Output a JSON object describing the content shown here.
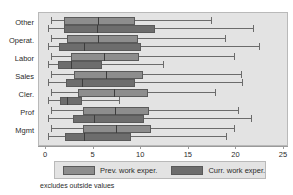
{
  "chart_data": {
    "type": "box",
    "title": "",
    "xlabel": "",
    "ylabel": "",
    "xlim": [
      0,
      25
    ],
    "xticks": [
      0,
      5,
      10,
      15,
      20,
      25
    ],
    "xticklabels": [
      "0",
      "5",
      "10",
      "15",
      "20",
      "25"
    ],
    "grid": false,
    "orientation": "horizontal",
    "categories": [
      "Other",
      "Operat.",
      "Labor",
      "Sales",
      "Cler.",
      "Prof",
      "Mgmt"
    ],
    "legend_position": "bottom",
    "footnote": "excludes outside values",
    "colors": {
      "prev": "#8d8d8d",
      "curr": "#6d6d6d",
      "plot_background": "#e3e3e3",
      "frame": "#b9b9b9",
      "line": "#6b6b6b",
      "text": "#2b2b2b"
    },
    "series": [
      {
        "name": "Prev. work exper.",
        "key": "prev",
        "boxes": [
          {
            "category": "Other",
            "whisker_low": 0.5,
            "q1": 1.9,
            "median": 5.5,
            "q3": 9.3,
            "whisker_high": 17.3
          },
          {
            "category": "Operat.",
            "whisker_low": 0.5,
            "q1": 2.2,
            "median": 5.5,
            "q3": 9.7,
            "whisker_high": 18.8
          },
          {
            "category": "Labor",
            "whisker_low": 0.5,
            "q1": 2.6,
            "median": 6.1,
            "q3": 9.8,
            "whisker_high": 19.8
          },
          {
            "category": "Sales",
            "whisker_low": 0.5,
            "q1": 2.9,
            "median": 6.3,
            "q3": 10.2,
            "whisker_high": 20.5
          },
          {
            "category": "Cler.",
            "whisker_low": 0.5,
            "q1": 3.4,
            "median": 7.1,
            "q3": 10.7,
            "whisker_high": 17.8
          },
          {
            "category": "Prof",
            "whisker_low": 0.5,
            "q1": 3.9,
            "median": 7.3,
            "q3": 10.8,
            "whisker_high": 20.2
          },
          {
            "category": "Mgmt",
            "whisker_low": 0.5,
            "q1": 3.9,
            "median": 7.4,
            "q3": 11.0,
            "whisker_high": 19.7
          }
        ]
      },
      {
        "name": "Curr. work exper.",
        "key": "curr",
        "boxes": [
          {
            "category": "Other",
            "whisker_low": 0.2,
            "q1": 1.9,
            "median": 5.4,
            "q3": 11.5,
            "whisker_high": 21.7
          },
          {
            "category": "Operat.",
            "whisker_low": 0.2,
            "q1": 1.4,
            "median": 4.0,
            "q3": 10.0,
            "whisker_high": 22.4
          },
          {
            "category": "Labor",
            "whisker_low": 0.2,
            "q1": 1.3,
            "median": 2.6,
            "q3": 5.9,
            "whisker_high": 12.3
          },
          {
            "category": "Sales",
            "whisker_low": 0.2,
            "q1": 2.1,
            "median": 3.8,
            "q3": 9.3,
            "whisker_high": 20.6
          },
          {
            "category": "Cler.",
            "whisker_low": 0.2,
            "q1": 1.5,
            "median": 2.2,
            "q3": 3.8,
            "whisker_high": 7.7
          },
          {
            "category": "Prof",
            "whisker_low": 0.2,
            "q1": 2.8,
            "median": 5.0,
            "q3": 10.3,
            "whisker_high": 21.5
          },
          {
            "category": "Mgmt",
            "whisker_low": 0.2,
            "q1": 2.0,
            "median": 4.0,
            "q3": 8.9,
            "whisker_high": 18.9
          }
        ]
      }
    ]
  }
}
